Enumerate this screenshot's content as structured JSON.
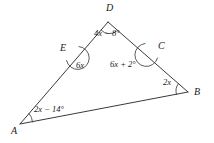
{
  "figure": {
    "type": "geometry-diagram",
    "background_color": "#ffffff",
    "line_color": "#3a3a3a",
    "text_color": "#1a1a1a",
    "vertices": [
      {
        "id": "D",
        "label": "D",
        "x": 108,
        "y": 22,
        "label_x": 106,
        "label_y": 3
      },
      {
        "id": "A",
        "label": "A",
        "x": 20,
        "y": 124,
        "label_x": 11,
        "label_y": 126
      },
      {
        "id": "B",
        "label": "B",
        "x": 188,
        "y": 92,
        "label_x": 194,
        "label_y": 87
      },
      {
        "id": "E",
        "label": "E",
        "x": 72,
        "y": 52,
        "label_x": 60,
        "label_y": 43
      },
      {
        "id": "C",
        "label": "C",
        "x": 152,
        "y": 50,
        "label_x": 158,
        "label_y": 41
      }
    ],
    "segments": [
      {
        "id": "segment-AD",
        "from": "A",
        "to": "D"
      },
      {
        "id": "segment-DB",
        "from": "D",
        "to": "B"
      },
      {
        "id": "segment-AB",
        "from": "A",
        "to": "B"
      }
    ],
    "angles": [
      {
        "id": "angle-D",
        "at": "D",
        "expression": "4x − 8°",
        "label_x": 94,
        "label_y": 29
      },
      {
        "id": "angle-E",
        "at": "E",
        "expression": "6x",
        "label_x": 76,
        "label_y": 61
      },
      {
        "id": "angle-C",
        "at": "C",
        "expression": "6x + 2°",
        "label_x": 110,
        "label_y": 60
      },
      {
        "id": "angle-B",
        "at": "B",
        "expression": "2x",
        "label_x": 163,
        "label_y": 78
      },
      {
        "id": "angle-A",
        "at": "A",
        "expression": "2x − 14°",
        "label_x": 34,
        "label_y": 105
      }
    ]
  }
}
